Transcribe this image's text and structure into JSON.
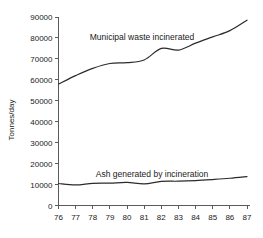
{
  "chart_data": {
    "type": "line",
    "title": "",
    "subtitle": "",
    "xlabel": "",
    "ylabel": "Tonnes/day",
    "xlim": [
      76,
      87
    ],
    "ylim": [
      0,
      90000
    ],
    "grid": false,
    "legend_position": "inline-annotation",
    "x": [
      76,
      77,
      78,
      79,
      80,
      81,
      82,
      83,
      84,
      85,
      86,
      87
    ],
    "xtick_labels": [
      "76",
      "77",
      "78",
      "79",
      "80",
      "81",
      "82",
      "83",
      "84",
      "85",
      "86",
      "87"
    ],
    "ytick_labels": [
      "0",
      "10000",
      "20000",
      "30000",
      "40000",
      "50000",
      "60000",
      "70000",
      "80000",
      "90000"
    ],
    "ytick_values": [
      0,
      10000,
      20000,
      30000,
      40000,
      50000,
      60000,
      70000,
      80000,
      90000
    ],
    "series": [
      {
        "name": "Municipal waste incinerated",
        "annotation": "Municipal waste incinerated",
        "color": "#2b2b2b",
        "values": [
          58000,
          62000,
          65500,
          67800,
          68200,
          69500,
          75000,
          74200,
          77500,
          80500,
          83500,
          88500
        ]
      },
      {
        "name": "Ash generated by incineration",
        "annotation": "Ash generated by incineration",
        "color": "#2b2b2b",
        "values": [
          10500,
          9800,
          10600,
          10700,
          11000,
          10300,
          11500,
          11600,
          11900,
          12400,
          13000,
          13800
        ]
      }
    ]
  },
  "axes": {
    "y_title": "Tonnes/day"
  },
  "colors": {
    "background": "#ffffff",
    "axis": "#5a5a5a",
    "line": "#2b2b2b",
    "text": "#1a1a1a"
  }
}
